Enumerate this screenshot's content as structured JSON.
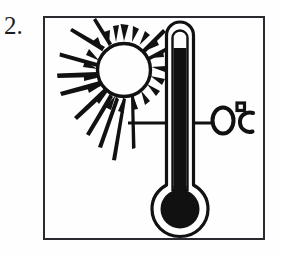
{
  "exercise": {
    "number_label": "2.",
    "frame": {
      "x": 43,
      "y": 16,
      "width": 222,
      "height": 224,
      "border_color": "#2a2a30"
    }
  },
  "illustration": {
    "title": "sun-and-thermometer-at-zero-degrees",
    "style": "black-and-white hand-drawn line art",
    "background_color": "#fefefe",
    "ink_color": "#111111",
    "sun": {
      "name": "sun-icon",
      "center_x": 124,
      "center_y": 70,
      "radius": 27,
      "outline_width": 3,
      "ray_count": 26,
      "description": "circle outline with many irregular tapered rays radiating outward, longest toward the left and lower-left"
    },
    "thermometer": {
      "name": "thermometer-icon",
      "tube_left": 166,
      "tube_right": 194,
      "tube_top": 22,
      "stem_bottom": 196,
      "inner_left": 173,
      "inner_right": 187,
      "mercury_top": 48,
      "bulb_center_x": 180,
      "bulb_center_y": 209,
      "bulb_outer_radius": 27,
      "bulb_fill_radius": 19,
      "description": "upright thermometer, rounded top, black mercury column nearly full, large black bulb at base"
    },
    "reading_line": {
      "name": "temperature-reading-line",
      "x_start": 128,
      "x_end": 212,
      "y": 123,
      "thickness": 3
    },
    "temperature_label": {
      "name": "temperature-label",
      "text": "0°C",
      "x": 212,
      "y": 123,
      "description": "hand-lettered zero degrees Celsius with small square degree mark"
    }
  }
}
